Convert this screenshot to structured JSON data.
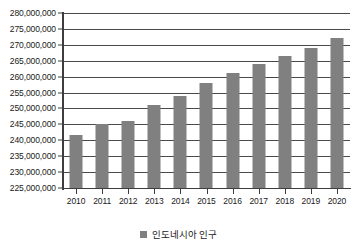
{
  "chart_data": {
    "type": "bar",
    "title": "",
    "subtitle": "",
    "xlabel": "",
    "ylabel": "",
    "categories": [
      "2010",
      "2011",
      "2012",
      "2013",
      "2014",
      "2015",
      "2016",
      "2017",
      "2018",
      "2019",
      "2020"
    ],
    "series": [
      {
        "name": "인도네시아 인구",
        "color": "#808080",
        "values": [
          241800000,
          245000000,
          246000000,
          251000000,
          254000000,
          258000000,
          261000000,
          264000000,
          266500000,
          269000000,
          272000000
        ]
      }
    ],
    "ylim": [
      225000000,
      280000000
    ],
    "ytick_step": 5000000,
    "ytick_labels": [
      "225,000,000",
      "230,000,000",
      "235,000,000",
      "240,000,000",
      "245,000,000",
      "250,000,000",
      "255,000,000",
      "260,000,000",
      "265,000,000",
      "270,000,000",
      "275,000,000",
      "280,000,000"
    ],
    "grid": true,
    "legend_position": "bottom",
    "legend_entries": [
      "인도네시아 인구"
    ]
  },
  "legend": {
    "label": "인도네시아 인구",
    "swatch_color": "#808080"
  },
  "colors": {
    "bar": "#808080",
    "axis": "#3d3d3d",
    "gridline": "#4a4a4a",
    "text": "#1a1a1a",
    "background": "#ffffff"
  }
}
